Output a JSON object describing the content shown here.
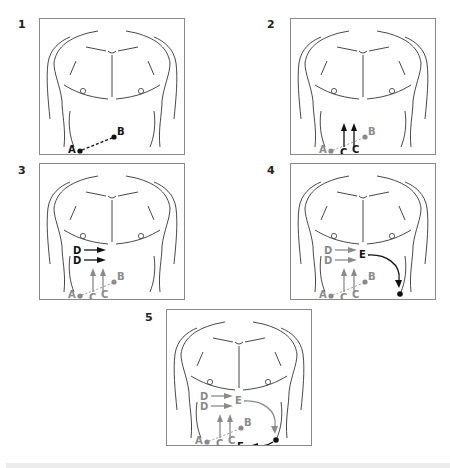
{
  "figure": {
    "colors": {
      "active": "#111111",
      "previous": "#8a8a8a",
      "outline": "#333333",
      "frame": "#888888"
    },
    "panels": [
      {
        "step": "1",
        "labels": {
          "A": "A",
          "B": "B"
        }
      },
      {
        "step": "2",
        "labels": {
          "A": "A",
          "B": "B",
          "C1": "C",
          "C2": "C"
        }
      },
      {
        "step": "3",
        "labels": {
          "A": "A",
          "B": "B",
          "C1": "C",
          "C2": "C",
          "D1": "D",
          "D2": "D"
        }
      },
      {
        "step": "4",
        "labels": {
          "A": "A",
          "B": "B",
          "C1": "C",
          "C2": "C",
          "D1": "D",
          "D2": "D",
          "E": "E"
        }
      },
      {
        "step": "5",
        "labels": {
          "A": "A",
          "B": "B",
          "C1": "C",
          "C2": "C",
          "D1": "D",
          "D2": "D",
          "E": "E",
          "F": "F"
        }
      }
    ]
  }
}
